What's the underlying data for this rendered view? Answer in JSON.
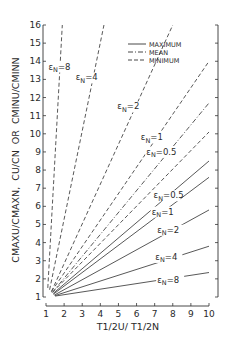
{
  "chart_data": {
    "type": "line",
    "title": "",
    "xlabel": "T1/2U / T1/2N",
    "ylabel": "CMAXU/CMAXN, CU/CN OR CMINU/CMINN",
    "xlim": [
      1,
      10
    ],
    "ylim": [
      1,
      16
    ],
    "x_ticks": [
      1,
      2,
      3,
      4,
      5,
      6,
      7,
      8,
      9,
      10
    ],
    "y_ticks": [
      1,
      2,
      3,
      4,
      5,
      6,
      7,
      8,
      9,
      10,
      11,
      12,
      13,
      14,
      15,
      16
    ],
    "grid": false,
    "legend": {
      "position": "upper right",
      "entries": [
        {
          "label": "MAXIMUM",
          "style": "solid"
        },
        {
          "label": "MEAN",
          "style": "dash-dot"
        },
        {
          "label": "MINIMUM",
          "style": "dashed"
        }
      ]
    },
    "series": [
      {
        "name": "MINIMUM εN=8",
        "style": "dashed",
        "x": [
          1.1,
          1.9
        ],
        "y": [
          1.5,
          16
        ]
      },
      {
        "name": "MINIMUM εN=4",
        "style": "dashed",
        "x": [
          1.2,
          4.2
        ],
        "y": [
          1.4,
          16
        ]
      },
      {
        "name": "MINIMUM εN=2",
        "style": "dashed",
        "x": [
          1.3,
          8.0
        ],
        "y": [
          1.3,
          16
        ]
      },
      {
        "name": "MINIMUM εN=1",
        "style": "dashed",
        "x": [
          1.3,
          10
        ],
        "y": [
          1.3,
          14.0
        ]
      },
      {
        "name": "MEAN εN=0.5 (upper)",
        "style": "dash-dot",
        "x": [
          1.35,
          10
        ],
        "y": [
          1.25,
          11.7
        ]
      },
      {
        "name": "MINIMUM εN=0.5",
        "style": "dashed",
        "x": [
          1.35,
          10
        ],
        "y": [
          1.25,
          10.1
        ]
      },
      {
        "name": "MAXIMUM εN=0.5",
        "style": "solid",
        "x": [
          1.4,
          10
        ],
        "y": [
          1.2,
          8.5
        ]
      },
      {
        "name": "MAXIMUM εN=1",
        "style": "solid",
        "x": [
          1.4,
          10
        ],
        "y": [
          1.15,
          7.6
        ]
      },
      {
        "name": "MAXIMUM εN=2",
        "style": "solid",
        "x": [
          1.45,
          10
        ],
        "y": [
          1.1,
          5.8
        ]
      },
      {
        "name": "MAXIMUM εN=4",
        "style": "solid",
        "x": [
          1.5,
          10
        ],
        "y": [
          1.08,
          3.8
        ]
      },
      {
        "name": "MAXIMUM εN=8",
        "style": "solid",
        "x": [
          1.5,
          10
        ],
        "y": [
          1.05,
          2.35
        ]
      }
    ],
    "annotations": [
      {
        "text": "εN=8",
        "x": 1.8,
        "y": 13.6
      },
      {
        "text": "εN=4",
        "x": 3.3,
        "y": 13.0
      },
      {
        "text": "εN=2",
        "x": 5.6,
        "y": 11.4
      },
      {
        "text": "εN=1",
        "x": 6.9,
        "y": 9.7
      },
      {
        "text": "εN=0.5",
        "x": 7.2,
        "y": 8.9
      },
      {
        "text": "εN=0.5",
        "x": 7.6,
        "y": 6.5
      },
      {
        "text": "εN=1",
        "x": 7.5,
        "y": 5.6
      },
      {
        "text": "εN=2",
        "x": 7.8,
        "y": 4.6
      },
      {
        "text": "εN=4",
        "x": 7.7,
        "y": 3.1
      },
      {
        "text": "εN=8",
        "x": 7.8,
        "y": 1.85
      }
    ]
  },
  "labels": {
    "x_axis": "T1/2U/ T1/2N",
    "y_axis_part1": "CMAXU/CMAXN,",
    "y_axis_part2": "CU/CN",
    "y_axis_part3": "OR",
    "y_axis_part4": "CMINU/CMINN",
    "legend_max": "MAXIMUM",
    "legend_mean": "MEAN",
    "legend_min": "MINIMUM"
  }
}
